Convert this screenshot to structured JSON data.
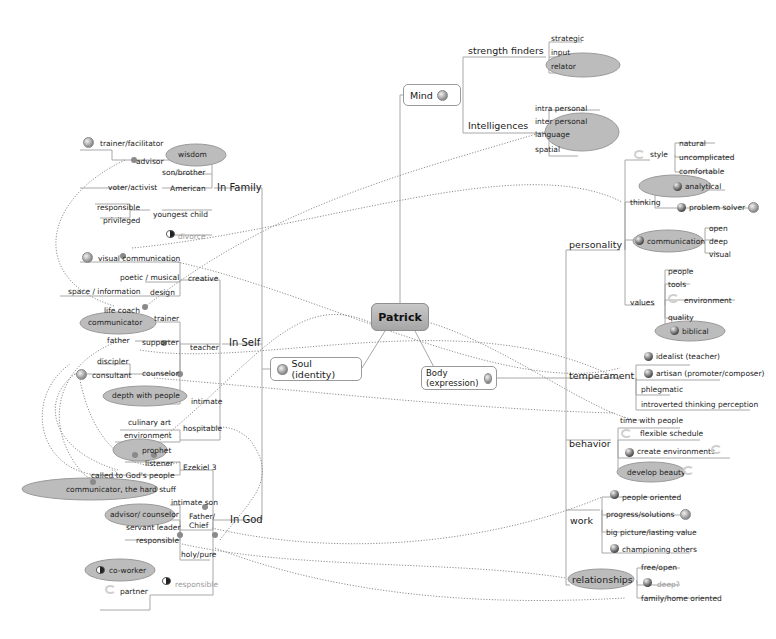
{
  "center": {
    "label": "Patrick"
  },
  "main_branches": {
    "mind": "Mind",
    "soul": "Soul (identity)",
    "body": "Body (expression)"
  },
  "mind": {
    "strength_finders": {
      "label": "strength finders",
      "items": [
        "strategic",
        "input",
        "relator"
      ]
    },
    "intelligences": {
      "label": "Intelligences",
      "items": [
        "intra personal",
        "inter personal",
        "language",
        "spatial"
      ]
    }
  },
  "soul": {
    "in_family": {
      "label": "In Family",
      "items": {
        "wisdom": "wisdom",
        "trainer_facilitator": "trainer/facilitator",
        "advisor": "advisor",
        "son_brother": "son/brother",
        "american": "American",
        "voter_activist": "voter/activist",
        "youngest_child": "youngest child",
        "responsible": "responsible",
        "privileged": "privileged",
        "divorce": "divorce"
      }
    },
    "in_self": {
      "label": "In Self",
      "items": {
        "visual_communication": "visual communication",
        "creative": "creative",
        "poetic_musical": "poetic / musical",
        "design": "design",
        "space_information": "space / information",
        "teacher": "teacher",
        "life_coach": "life coach",
        "communicator": "communicator",
        "trainer": "trainer",
        "father": "father",
        "supporter": "supporter",
        "counselor": "counselor",
        "discipler": "discipler",
        "consultant": "consultant",
        "intimate": "intimate",
        "depth_with_people": "depth with people",
        "hospitable": "hospitable",
        "culinary_art": "culinary art",
        "environment": "environment"
      }
    },
    "in_god": {
      "label": "In God",
      "items": {
        "ezekiel_3": "Ezekiel 3",
        "prophet": "prophet",
        "listener": "listener",
        "called": "called to God's people",
        "communicator_hard": "communicator, the hard stuff",
        "father_chief": "Father/ Chief",
        "intimate_son": "intimate son",
        "advisor_counselor": "advisor/ counselor",
        "servant_leader": "servant leader",
        "responsible": "responsible",
        "holy_pure": "holy/pure",
        "responsible_dim": "responsible",
        "co_worker": "co-worker",
        "partner": "partner"
      }
    }
  },
  "body": {
    "personality": {
      "label": "personality",
      "style": {
        "label": "style",
        "items": [
          "natural",
          "uncomplicated",
          "comfortable"
        ]
      },
      "thinking": {
        "label": "thinking",
        "items": [
          "analytical",
          "problem solver"
        ]
      },
      "communication": {
        "label": "communication",
        "items": [
          "open",
          "deep",
          "visual"
        ]
      },
      "values": {
        "label": "values",
        "items": [
          "people",
          "tools",
          "environment",
          "quality",
          "biblical"
        ]
      }
    },
    "temperament": {
      "label": "temperament",
      "items": [
        "idealist (teacher)",
        "artisan (promoter/composer)",
        "phlegmatic",
        "introverted thinking perception"
      ]
    },
    "behavior": {
      "label": "behavior",
      "items": [
        "time with people",
        "flexible schedule",
        "create environments",
        "develop beauty"
      ]
    },
    "work": {
      "label": "work",
      "items": [
        "people oriented",
        "progress/solutions",
        "big picture/lasting value",
        "championing others"
      ]
    },
    "relationships": {
      "label": "relationships",
      "items": [
        "free/open",
        "deep?",
        "family/home oriented"
      ]
    }
  },
  "colors": {
    "highlight_ellipse": "#b9b9b9",
    "center_fill": "#b4b4b4",
    "line": "#a0a0a0",
    "dotted_link": "#8f8f8f",
    "dim_text": "#9a9a9a"
  }
}
